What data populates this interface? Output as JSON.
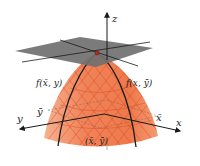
{
  "figure": {
    "colors": {
      "surface": "#f0845a",
      "surface_light": "#f6a27e",
      "mesh": "#d8451c",
      "plane": "#6f6f6f",
      "axis": "#1a1a1a",
      "point": "#c0281c"
    },
    "labels": {
      "z_axis": "z",
      "x_axis": "x",
      "y_axis": "y",
      "trace_x_fixed": "f(x̄, y)",
      "trace_y_fixed": "f(x, ȳ)",
      "y_bar": "ȳ",
      "x_bar": "x̄",
      "point": "(x̄, ȳ)"
    }
  }
}
